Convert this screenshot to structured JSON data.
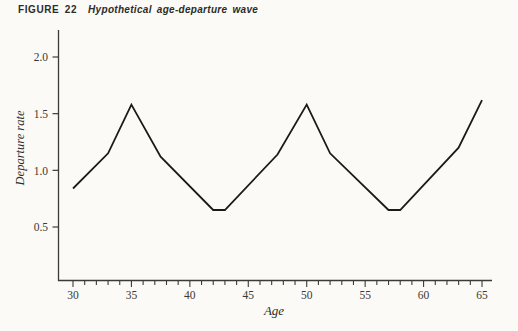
{
  "title": {
    "figure_label": "FIGURE 22",
    "caption": "Hypothetical age-departure wave"
  },
  "colors": {
    "background": "#fbfaf6",
    "ink": "#2e2c28",
    "axis": "#3d3b37",
    "line": "#1b1a18"
  },
  "chart_data": {
    "type": "line",
    "xlabel": "Age",
    "ylabel": "Departure rate",
    "x_major_ticks": [
      30,
      35,
      40,
      45,
      50,
      55,
      60,
      65
    ],
    "x_minor_tick_step": 1,
    "x_axis_range": [
      28.7,
      65.9
    ],
    "y_ticks": [
      "0.5",
      "1.0",
      "1.5",
      "2.0"
    ],
    "y_value_range_shown": [
      0.03,
      2.2
    ],
    "grid": false,
    "legend": "none",
    "series": [
      {
        "name": "departure-rate-wave",
        "points": [
          [
            30,
            0.84
          ],
          [
            33,
            1.15
          ],
          [
            35,
            1.58
          ],
          [
            37.5,
            1.12
          ],
          [
            42,
            0.65
          ],
          [
            43,
            0.65
          ],
          [
            47.5,
            1.14
          ],
          [
            50,
            1.58
          ],
          [
            52,
            1.15
          ],
          [
            57,
            0.65
          ],
          [
            58,
            0.65
          ],
          [
            63,
            1.2
          ],
          [
            65,
            1.62
          ]
        ]
      }
    ]
  }
}
